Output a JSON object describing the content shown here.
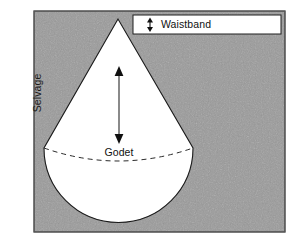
{
  "figure": {
    "width": 297,
    "height": 242
  },
  "labels": {
    "selvage": "Selvage",
    "godet": "Godet",
    "waistband": "Waistband"
  },
  "colors": {
    "fabric_gray": "#9a9a9a",
    "fabric_gray_dark": "#8e8e8e",
    "piece_white": "#ffffff",
    "outline": "#1a1a1a",
    "text": "#111111",
    "page_background": "#ffffff"
  },
  "geometry": {
    "fabric_rect": {
      "x": 34,
      "y": 11,
      "width": 251,
      "height": 221
    },
    "godet_apex": {
      "x": 118,
      "y": 19
    },
    "godet_left_corner": {
      "x": 44,
      "y": 148
    },
    "godet_right_corner": {
      "x": 193,
      "y": 148
    },
    "godet_arc_bottom": {
      "x": 118,
      "y": 223
    },
    "dashed_arc_sag": {
      "x": 118,
      "y": 162
    },
    "grain_arrow": {
      "x": 119,
      "y_top": 68,
      "y_bottom": 142
    },
    "waistband_box": {
      "x": 133,
      "y": 15,
      "width": 148,
      "height": 19
    },
    "waistband_arrow": {
      "x": 150,
      "y_top": 18,
      "y_bottom": 31
    }
  },
  "annotations": {
    "grain_arrow_name": "double-headed-grainline-arrow",
    "waistband_arrow_name": "double-headed-waistband-depth-arrow",
    "dashed_curve_name": "dashed-hemline-guide"
  }
}
